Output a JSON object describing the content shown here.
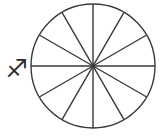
{
  "figure": {
    "background_color": "#ffffff",
    "stroke_color": "#3a3a3a",
    "stroke_width": 1.4
  },
  "circle": {
    "label": "sector-circle",
    "center_x": 93,
    "center_y": 66,
    "radius": 62,
    "fill": "#ffffff",
    "stroke": "#3a3a3a"
  },
  "symbol": {
    "name": "sagittarius",
    "glyph": "♐",
    "label": "Sagittarius",
    "x": 17,
    "y": 68,
    "font_size": 25,
    "color": "#2b2b2b"
  },
  "chart_data": {
    "type": "pie",
    "categories": [
      "Sector 1",
      "Sector 2",
      "Sector 3",
      "Sector 4",
      "Sector 5",
      "Sector 6",
      "Sector 7",
      "Sector 8",
      "Sector 9",
      "Sector 10",
      "Sector 11",
      "Sector 12"
    ],
    "values": [
      1,
      1,
      1,
      1,
      1,
      1,
      1,
      1,
      1,
      1,
      1,
      1
    ],
    "sector_count": 12,
    "sector_angle_degrees": 30,
    "total_degrees": 360,
    "fraction_each": "1/12",
    "legend": false,
    "grid": false,
    "labels_shown": false,
    "annotation": "♐"
  },
  "spokes": [
    {
      "name": "spoke-0-180",
      "angle_degrees": 0,
      "x1": 31,
      "y1": 66,
      "x2": 155,
      "y2": 66
    },
    {
      "name": "spoke-30-210",
      "angle_degrees": 30,
      "x1": 39.3,
      "y1": 35,
      "x2": 146.7,
      "y2": 97
    },
    {
      "name": "spoke-60-240",
      "angle_degrees": 60,
      "x1": 62,
      "y1": 12.3,
      "x2": 124,
      "y2": 119.7
    },
    {
      "name": "spoke-90-270",
      "angle_degrees": 90,
      "x1": 93,
      "y1": 4,
      "x2": 93,
      "y2": 128
    },
    {
      "name": "spoke-120-300",
      "angle_degrees": 120,
      "x1": 124,
      "y1": 12.3,
      "x2": 62,
      "y2": 119.7
    },
    {
      "name": "spoke-150-330",
      "angle_degrees": 150,
      "x1": 146.7,
      "y1": 35,
      "x2": 39.3,
      "y2": 97
    }
  ]
}
